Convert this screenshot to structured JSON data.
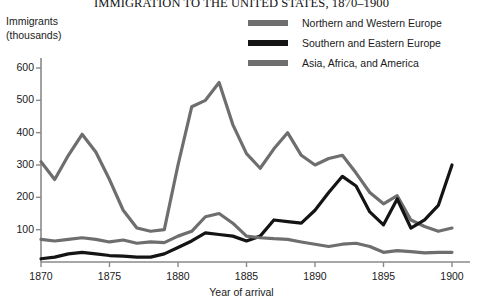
{
  "chart_data": {
    "type": "line",
    "title": "IMMIGRATION TO THE UNITED STATES, 1870–1900",
    "xlabel": "Year of arrival",
    "ylabel_lines": [
      "Immigrants",
      "(thousands)"
    ],
    "xlim": [
      1870,
      1900
    ],
    "ylim": [
      0,
      600
    ],
    "grid": false,
    "legend_position": "top-right",
    "x_ticks": [
      1870,
      1875,
      1880,
      1885,
      1890,
      1895,
      1900
    ],
    "x_tick_labels": [
      "1870",
      "1875",
      "1880",
      "1885",
      "1890",
      "1895",
      "1900"
    ],
    "y_ticks": [
      100,
      200,
      300,
      400,
      500,
      600
    ],
    "y_tick_labels": [
      "100",
      "200",
      "300",
      "400",
      "500",
      "600"
    ],
    "x": [
      1870,
      1871,
      1872,
      1873,
      1874,
      1875,
      1876,
      1877,
      1878,
      1879,
      1880,
      1881,
      1882,
      1883,
      1884,
      1885,
      1886,
      1887,
      1888,
      1889,
      1890,
      1891,
      1892,
      1893,
      1894,
      1895,
      1896,
      1897,
      1898,
      1899,
      1900
    ],
    "series": [
      {
        "name": "Northern and Western Europe",
        "color": "#6e6e6e",
        "values": [
          310,
          255,
          330,
          395,
          340,
          255,
          160,
          105,
          95,
          100,
          300,
          480,
          500,
          555,
          425,
          335,
          290,
          350,
          400,
          330,
          300,
          320,
          330,
          275,
          215,
          180,
          205,
          130,
          110,
          95,
          105
        ]
      },
      {
        "name": "Southern and Eastern Europe",
        "color": "#141414",
        "values": [
          10,
          15,
          25,
          30,
          25,
          20,
          18,
          15,
          15,
          25,
          45,
          65,
          90,
          85,
          80,
          65,
          80,
          130,
          125,
          120,
          160,
          215,
          265,
          235,
          155,
          115,
          195,
          105,
          130,
          175,
          300
        ]
      },
      {
        "name": "Asia, Africa, and America",
        "color": "#6e6e6e",
        "values": [
          70,
          65,
          70,
          75,
          70,
          62,
          68,
          58,
          62,
          60,
          80,
          95,
          140,
          150,
          120,
          80,
          75,
          72,
          70,
          62,
          55,
          48,
          55,
          58,
          48,
          30,
          35,
          32,
          28,
          30,
          30
        ]
      }
    ]
  },
  "axes": {
    "y_title_line1": "Immigrants",
    "y_title_line2": "(thousands)",
    "x_title": "Year of arrival"
  },
  "legend": {
    "items": [
      {
        "label": "Northern and Western Europe",
        "color": "#6e6e6e"
      },
      {
        "label": "Southern and Eastern Europe",
        "color": "#141414"
      },
      {
        "label": "Asia, Africa, and America",
        "color": "#6e6e6e"
      }
    ]
  }
}
